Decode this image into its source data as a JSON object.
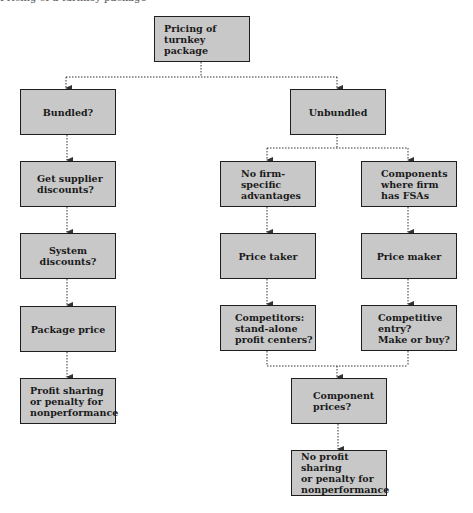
{
  "diagram": {
    "caption": "Pricing of a turnkey package",
    "nodes": {
      "root": "Pricing of\nturnkey package",
      "bundled": "Bundled?",
      "unbundled": "Unbundled",
      "supplier_discounts": "Get supplier\ndiscounts?",
      "system_discounts": "System discounts?",
      "package_price": "Package price",
      "profit_sharing": "Profit sharing\nor penalty for\nnonperformance",
      "no_fsa": "No firm-\nspecific\nadvantages",
      "fsa_components": "Components\nwhere firm\nhas FSAs",
      "price_taker": "Price taker",
      "price_maker": "Price maker",
      "competitors": "Competitors:\nstand-alone\nprofit centers?",
      "competitive_entry": "Competitive\nentry?\nMake or buy?",
      "component_prices": "Component\nprices?",
      "no_profit_sharing": "No profit sharing\nor penalty for\nnonperformance"
    },
    "colors": {
      "box_fill": "#c8c8c8",
      "box_border": "#1e1e1e",
      "connector": "#333333"
    }
  }
}
